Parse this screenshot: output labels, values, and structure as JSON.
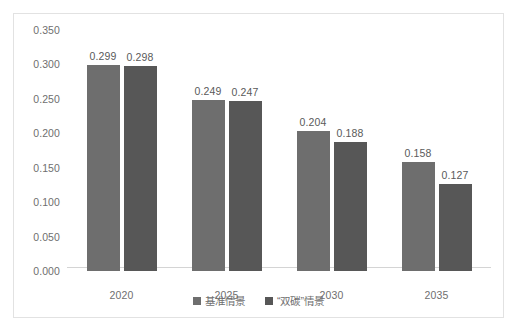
{
  "chart_data": {
    "type": "bar",
    "title": "",
    "subtitle": "",
    "xlabel": "",
    "ylabel": "",
    "categories": [
      "2020",
      "2025",
      "2030",
      "2035"
    ],
    "series": [
      {
        "name": "基准情景",
        "color": "#6e6e6e",
        "values": [
          0.299,
          0.249,
          0.204,
          0.158
        ]
      },
      {
        "name": "“双碳”情景",
        "color": "#575757",
        "values": [
          0.298,
          0.247,
          0.188,
          0.127
        ]
      }
    ],
    "value_labels": [
      [
        "0.299",
        "0.249",
        "0.204",
        "0.158"
      ],
      [
        "0.298",
        "0.247",
        "0.188",
        "0.127"
      ]
    ],
    "ylim": [
      0.0,
      0.35
    ],
    "ytick_step": 0.05,
    "ytick_labels": [
      "0.350",
      "0.300",
      "0.250",
      "0.200",
      "0.150",
      "0.100",
      "0.050",
      "0.000"
    ],
    "ytick_values": [
      0.35,
      0.3,
      0.25,
      0.2,
      0.15,
      0.1,
      0.05,
      0.0
    ],
    "grid": false,
    "legend_position": "bottom",
    "plot_background": "#ffffff",
    "border_color": "#e2e2e2",
    "axis_color": "#d4d4d4",
    "label_color": "#6f6f6f"
  },
  "legend": {
    "items": [
      {
        "label": "基准情景"
      },
      {
        "label": "“双碳”情景"
      }
    ]
  }
}
